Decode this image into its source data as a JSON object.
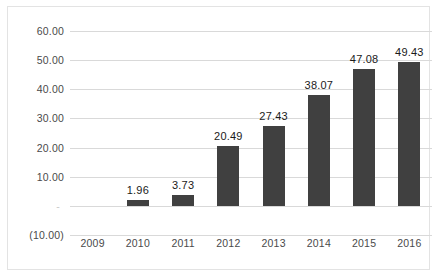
{
  "chart_data": {
    "type": "bar",
    "title": "",
    "xlabel": "",
    "ylabel": "",
    "categories": [
      "2009",
      "2010",
      "2011",
      "2012",
      "2013",
      "2014",
      "2015",
      "2016"
    ],
    "values": [
      0,
      1.96,
      3.73,
      20.49,
      27.43,
      38.07,
      47.08,
      49.43
    ],
    "point_labels": [
      "",
      "1.96",
      "3.73",
      "20.49",
      "27.43",
      "38.07",
      "47.08",
      "49.43"
    ],
    "ylim": [
      -10,
      60
    ],
    "ytick_values": [
      60,
      50,
      40,
      30,
      20,
      10,
      0,
      -10
    ],
    "ytick_labels": [
      "60.00",
      "50.00",
      "40.00",
      "30.00",
      "20.00",
      "10.00",
      "-",
      "(10.00)"
    ],
    "grid": true,
    "legend": false,
    "legend_position": "none",
    "bar_color": "#404040",
    "gridline_color": "#d9d9d9",
    "label_color": "#4a4a4a",
    "value_label_color": "#1a1a1a",
    "border_color": "#e3e3e3"
  }
}
